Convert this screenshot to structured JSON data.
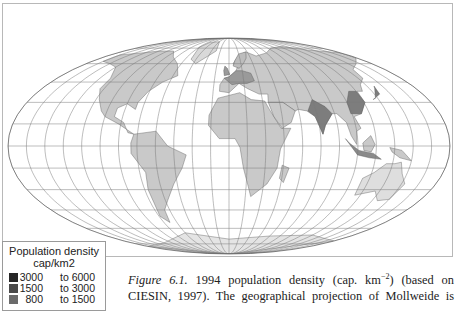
{
  "figure": {
    "label": "Figure 6.1.",
    "caption_line1_a": " 1994 population density (cap. km",
    "caption_sup": "−2",
    "caption_line1_b": ") (based on",
    "caption_line2": "CIESIN, 1997). The geographical projection of Mollweide is",
    "projection": "Mollweide"
  },
  "legend": {
    "title_line1": "Population density",
    "title_line2": "cap/km2",
    "classes": [
      {
        "from": "3000",
        "to": "to 6000",
        "color": "#262626"
      },
      {
        "from": "1500",
        "to": "to 3000",
        "color": "#4a4a4a"
      },
      {
        "from": "800",
        "to": "to 1500",
        "color": "#6b6b6b"
      }
    ]
  },
  "map": {
    "graticule_color": "#7a7a7a",
    "land_base_color": "#c9c9c9",
    "land_dense_color": "#7d7d7d",
    "ocean_color": "#ffffff"
  }
}
